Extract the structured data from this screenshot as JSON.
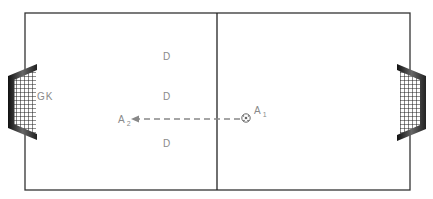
{
  "diagram": {
    "type": "soccer-drill",
    "field": {
      "line_color": "#333333",
      "background": "#ffffff"
    },
    "labels": {
      "goalkeeper": "GK",
      "defenders": [
        "D",
        "D",
        "D"
      ],
      "attacker1": {
        "main": "A",
        "sub": "1"
      },
      "attacker2": {
        "main": "A",
        "sub": "2"
      }
    },
    "pass": {
      "from": "A1",
      "to": "A2",
      "style": "dashed-arrow",
      "color": "#888888"
    },
    "ball": {
      "holder": "A1"
    },
    "goals": [
      "left",
      "right"
    ]
  }
}
